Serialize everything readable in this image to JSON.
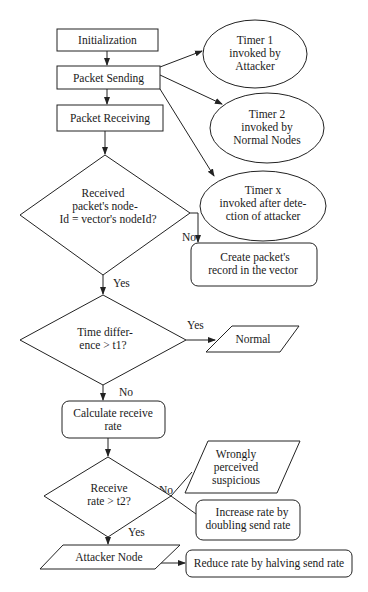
{
  "diagram": {
    "type": "flowchart",
    "nodes": {
      "init": {
        "shape": "process",
        "lines": [
          "Initialization"
        ]
      },
      "send": {
        "shape": "process",
        "lines": [
          "Packet Sending"
        ]
      },
      "recv": {
        "shape": "process",
        "lines": [
          "Packet Receiving"
        ]
      },
      "timer1": {
        "shape": "ellipse",
        "lines": [
          "Timer 1",
          "invoked by",
          "Attacker"
        ]
      },
      "timer2": {
        "shape": "ellipse",
        "lines": [
          "Timer 2",
          "invoked by",
          "Normal Nodes"
        ]
      },
      "timerx": {
        "shape": "ellipse",
        "lines": [
          "Timer x",
          "invoked after dete-",
          "ction of attacker"
        ]
      },
      "dec1": {
        "shape": "decision",
        "lines": [
          "Received",
          "packet's node-",
          "Id = vector's nodeId?"
        ]
      },
      "create": {
        "shape": "rounded",
        "lines": [
          "Create packet's",
          "record in the vector"
        ]
      },
      "dec2": {
        "shape": "decision",
        "lines": [
          "Time differ-",
          "ence > t1?"
        ]
      },
      "normal": {
        "shape": "io",
        "lines": [
          "Normal"
        ]
      },
      "calc": {
        "shape": "rounded",
        "lines": [
          "Calculate receive",
          "rate"
        ]
      },
      "dec3": {
        "shape": "decision",
        "lines": [
          "Receive",
          "rate > t2?"
        ]
      },
      "wrong": {
        "shape": "io",
        "lines": [
          "Wrongly",
          "perceived",
          "suspicious"
        ]
      },
      "increase": {
        "shape": "rounded",
        "lines": [
          "Increase rate by",
          "doubling send rate"
        ]
      },
      "attacker": {
        "shape": "io",
        "lines": [
          "Attacker Node"
        ]
      },
      "reduce": {
        "shape": "rounded",
        "lines": [
          "Reduce rate by halving send rate"
        ]
      }
    },
    "edges": [
      {
        "from": "init",
        "to": "send",
        "label": ""
      },
      {
        "from": "send",
        "to": "recv",
        "label": ""
      },
      {
        "from": "send",
        "to": "timer1",
        "label": ""
      },
      {
        "from": "send",
        "to": "timer2",
        "label": ""
      },
      {
        "from": "send",
        "to": "timerx",
        "label": ""
      },
      {
        "from": "recv",
        "to": "dec1",
        "label": ""
      },
      {
        "from": "dec1",
        "to": "create",
        "label": "No"
      },
      {
        "from": "dec1",
        "to": "dec2",
        "label": "Yes"
      },
      {
        "from": "dec2",
        "to": "normal",
        "label": "Yes"
      },
      {
        "from": "dec2",
        "to": "calc",
        "label": "No"
      },
      {
        "from": "calc",
        "to": "dec3",
        "label": ""
      },
      {
        "from": "dec3",
        "to": "wrong",
        "label": "No"
      },
      {
        "from": "dec3",
        "to": "increase",
        "label": ""
      },
      {
        "from": "dec3",
        "to": "attacker",
        "label": "Yes"
      },
      {
        "from": "attacker",
        "to": "reduce",
        "label": ""
      }
    ]
  }
}
